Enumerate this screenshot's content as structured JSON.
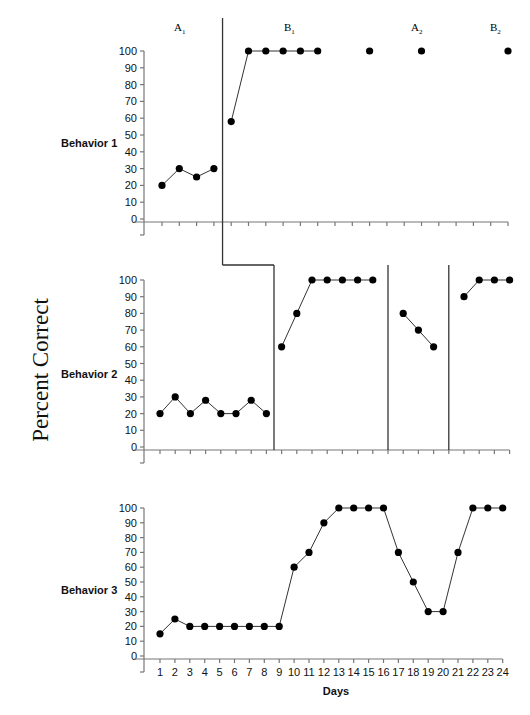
{
  "chart_data": {
    "type": "line",
    "title": "",
    "ylabel": "Percent Correct",
    "xlabel": "Days",
    "ylim": [
      0,
      100
    ],
    "yticks": [
      0,
      10,
      20,
      30,
      40,
      50,
      60,
      70,
      80,
      90,
      100
    ],
    "xticks": [
      1,
      2,
      3,
      4,
      5,
      6,
      7,
      8,
      9,
      10,
      11,
      12,
      13,
      14,
      15,
      16,
      17,
      18,
      19,
      20,
      21,
      22,
      23,
      24
    ],
    "grid": false,
    "phase_labels": [
      {
        "main": "A",
        "sub": "1"
      },
      {
        "main": "B",
        "sub": "1"
      },
      {
        "main": "A",
        "sub": "2"
      },
      {
        "main": "B",
        "sub": "2"
      }
    ],
    "panels": [
      {
        "name": "Behavior 1",
        "num_days": 21,
        "phase_change_after_days": [
          4
        ],
        "segments": [
          {
            "x": [
              1,
              2,
              3,
              4
            ],
            "y": [
              20,
              30,
              25,
              30
            ]
          },
          {
            "x": [
              5,
              6,
              7,
              8,
              9,
              10
            ],
            "y": [
              58,
              100,
              100,
              100,
              100,
              100
            ]
          },
          {
            "x": [
              13
            ],
            "y": [
              100
            ]
          },
          {
            "x": [
              16
            ],
            "y": [
              100
            ]
          },
          {
            "x": [
              21
            ],
            "y": [
              100
            ]
          }
        ]
      },
      {
        "name": "Behavior 2",
        "num_days": 24,
        "phase_change_after_days": [
          8,
          15.5,
          19.5
        ],
        "segments": [
          {
            "x": [
              1,
              2,
              3,
              4,
              5,
              6,
              7,
              8
            ],
            "y": [
              20,
              30,
              20,
              28,
              20,
              20,
              28,
              20
            ]
          },
          {
            "x": [
              9,
              10,
              11,
              12,
              13,
              14,
              15
            ],
            "y": [
              60,
              80,
              100,
              100,
              100,
              100,
              100
            ]
          },
          {
            "x": [
              17,
              18,
              19
            ],
            "y": [
              80,
              70,
              60
            ]
          },
          {
            "x": [
              21,
              22,
              23,
              24
            ],
            "y": [
              90,
              100,
              100,
              100
            ]
          }
        ]
      },
      {
        "name": "Behavior 3",
        "num_days": 24,
        "phase_change_after_days": [],
        "segments": [
          {
            "x": [
              1,
              2,
              3,
              4,
              5,
              6,
              7,
              8,
              9,
              10,
              11,
              12,
              13,
              14,
              15,
              16,
              17,
              18,
              19,
              20,
              21,
              22,
              23,
              24
            ],
            "y": [
              15,
              25,
              20,
              20,
              20,
              20,
              20,
              20,
              20,
              60,
              70,
              90,
              100,
              100,
              100,
              100,
              70,
              50,
              30,
              30,
              70,
              100,
              100,
              100
            ]
          }
        ]
      }
    ]
  },
  "labels": {
    "ytitle": "Percent Correct",
    "xtitle": "Days",
    "behavior_1": "Behavior 1",
    "behavior_2": "Behavior 2",
    "behavior_3": "Behavior 3"
  }
}
